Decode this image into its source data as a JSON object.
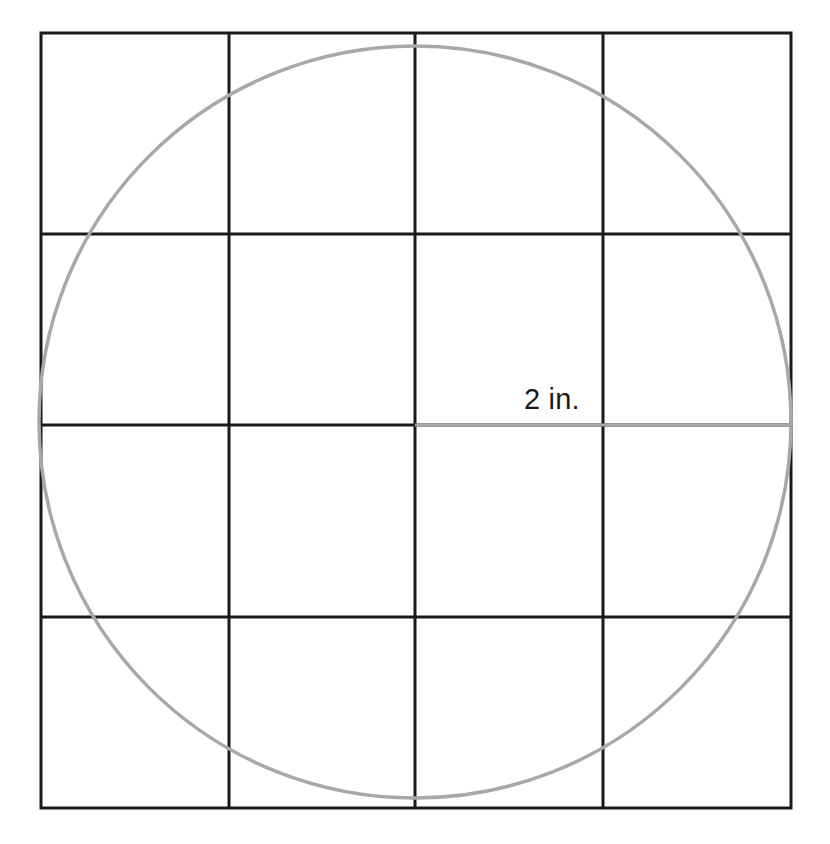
{
  "figure": {
    "canvas": {
      "width": 830,
      "height": 844
    },
    "colors": {
      "background": "#ffffff",
      "grid_line": "#1a1a1a",
      "square_border": "#1a1a1a",
      "circle_stroke": "#a8a8a8",
      "radius_line": "#a8a8a8",
      "label_text": "#1a1a1a"
    },
    "square": {
      "x": 41,
      "y": 33,
      "width": 750,
      "height": 775,
      "stroke_width": 3,
      "rows": 4,
      "columns": 4
    },
    "grid": {
      "vertical_line_x": [
        229,
        415,
        603
      ],
      "horizontal_line_y": [
        234,
        425,
        617
      ],
      "stroke_width": 3
    },
    "circle": {
      "center_x": 415,
      "center_y": 422,
      "radius": 376,
      "stroke_width": 3.5
    },
    "radius_line": {
      "x1": 415,
      "y1": 425,
      "x2": 791,
      "y2": 425,
      "stroke_width": 3
    },
    "radius_label": {
      "text": "2 in.",
      "x": 524,
      "y": 385
    }
  }
}
